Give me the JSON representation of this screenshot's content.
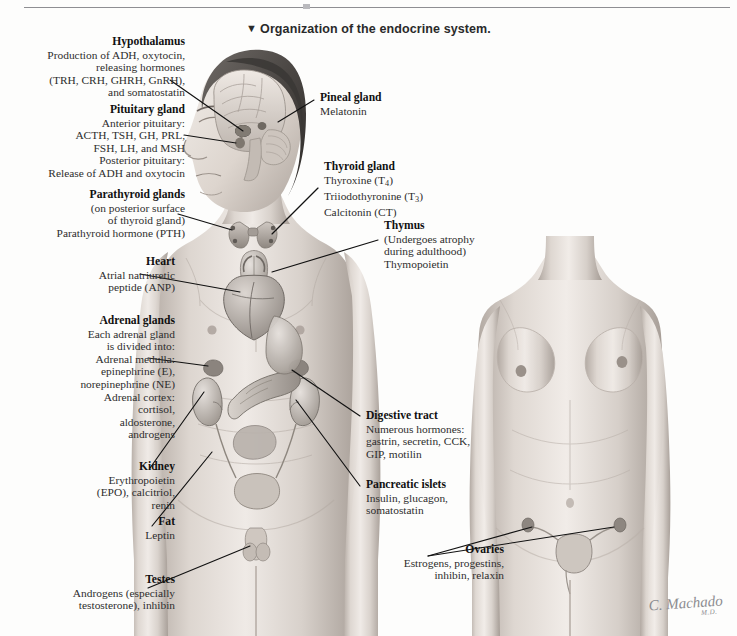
{
  "figure": {
    "title": "Organization of the endocrine system.",
    "title_marker": "▼",
    "signature": "C. Machado",
    "signature_credential": "M.D."
  },
  "labels": [
    {
      "id": "hypothalamus",
      "title": "Hypothalamus",
      "lines": [
        "Production of ADH, oxytocin,",
        "releasing hormones",
        "(TRH, CRH, GHRH, GnRH),",
        "and somatostatin"
      ]
    },
    {
      "id": "pituitary-gland",
      "title": "Pituitary gland",
      "lines": [
        "Anterior pituitary:",
        "ACTH, TSH, GH, PRL,",
        "FSH, LH, and MSH",
        "Posterior pituitary:",
        "Release of ADH and oxytocin"
      ]
    },
    {
      "id": "parathyroid-glands",
      "title": "Parathyroid glands",
      "lines": [
        "(on posterior surface",
        "of thyroid gland)",
        "Parathyroid hormone (PTH)"
      ]
    },
    {
      "id": "heart",
      "title": "Heart",
      "lines": [
        "Atrial natriuretic",
        "peptide (ANP)"
      ]
    },
    {
      "id": "adrenal-glands",
      "title": "Adrenal glands",
      "lines": [
        "Each adrenal gland",
        "is divided into:",
        "Adrenal medulla:",
        "epinephrine (E),",
        "norepinephrine (NE)",
        "Adrenal cortex:",
        "cortisol,",
        "aldosterone,",
        "androgens"
      ]
    },
    {
      "id": "kidney",
      "title": "Kidney",
      "lines": [
        "Erythropoietin",
        "(EPO), calcitriol,",
        "renin"
      ]
    },
    {
      "id": "fat",
      "title": "Fat",
      "lines": [
        "Leptin"
      ]
    },
    {
      "id": "testes",
      "title": "Testes",
      "lines": [
        "Androgens (especially",
        "testosterone), inhibin"
      ]
    },
    {
      "id": "pineal-gland",
      "title": "Pineal gland",
      "lines": [
        "Melatonin"
      ]
    },
    {
      "id": "thyroid-gland",
      "title": "Thyroid gland",
      "lines_html": [
        "Thyroxine (T<sub>4</sub>)",
        "Triiodothyronine (T<sub>3</sub>)",
        "Calcitonin (CT)"
      ]
    },
    {
      "id": "thymus",
      "title": "Thymus",
      "lines": [
        "(Undergoes atrophy",
        "during adulthood)",
        "Thymopoietin"
      ]
    },
    {
      "id": "digestive-tract",
      "title": "Digestive tract",
      "lines": [
        "Numerous hormones:",
        "gastrin, secretin, CCK,",
        "GIP, motilin"
      ]
    },
    {
      "id": "pancreatic-islets",
      "title": "Pancreatic islets",
      "lines": [
        "Insulin, glucagon,",
        "somatostatin"
      ]
    },
    {
      "id": "ovaries",
      "title": "Ovaries",
      "lines": [
        "Estrogens, progestins,",
        "inhibin, relaxin"
      ]
    }
  ],
  "colors": {
    "rule": "#8e8e92",
    "text": "#1c1c1c",
    "leader_line": "#111111",
    "skin_light": "#e8e2dd",
    "skin_mid": "#cfc6bf",
    "skin_shadow": "#a89e97",
    "organ_gray": "#b5b0ac",
    "signature": "#8c8c90"
  }
}
